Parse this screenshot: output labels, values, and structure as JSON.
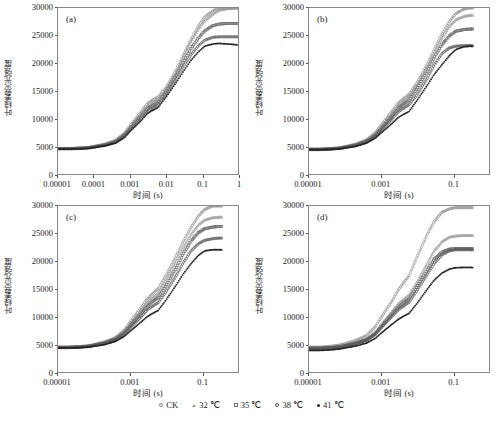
{
  "figure": {
    "ylabel": "叶绿素荧光强度",
    "xlabel": "时间 (s)",
    "panels": [
      {
        "tag": "(a)",
        "id": "a"
      },
      {
        "tag": "(b)",
        "id": "b"
      },
      {
        "tag": "(c)",
        "id": "c"
      },
      {
        "tag": "(d)",
        "id": "d"
      }
    ]
  },
  "legend": {
    "items": [
      {
        "label": "CK",
        "marker": "open-circle",
        "color": "#8c8c8c"
      },
      {
        "label": "32 ℃",
        "marker": "open-triangle",
        "color": "#9a9a9a"
      },
      {
        "label": "35 ℃",
        "marker": "open-square",
        "color": "#6e6e6e"
      },
      {
        "label": "38 ℃",
        "marker": "open-circle",
        "color": "#555555"
      },
      {
        "label": "41 ℃",
        "marker": "solid-dot",
        "color": "#222222"
      }
    ]
  },
  "yaxis": {
    "ticks": [
      "0",
      "5000",
      "10000",
      "15000",
      "20000",
      "25000",
      "30000"
    ],
    "min": 0,
    "max": 30000
  },
  "chart_data": [
    {
      "type": "line",
      "panel": "(a)",
      "title": "",
      "xlabel": "时间 (s)",
      "ylabel": "叶绿素荧光强度",
      "xscale": "log",
      "xlim": [
        1e-05,
        1
      ],
      "ylim": [
        0,
        30000
      ],
      "xticks": [
        "0.00001",
        "0.0001",
        "0.001",
        "0.01",
        "0.1",
        "1"
      ],
      "yticks": [
        0,
        5000,
        10000,
        15000,
        20000,
        25000,
        30000
      ],
      "grid": false,
      "legend_position": "bottom",
      "x": [
        2e-05,
        4e-05,
        7e-05,
        0.0001,
        0.0002,
        0.0004,
        0.0007,
        0.001,
        0.002,
        0.003,
        0.004,
        0.006,
        0.01,
        0.02,
        0.03,
        0.05,
        0.08,
        0.12,
        0.2,
        0.3,
        0.5,
        0.8,
        1.0
      ],
      "series": [
        {
          "name": "CK",
          "values": [
            4600,
            4700,
            4800,
            5000,
            5400,
            6100,
            7400,
            8700,
            11200,
            12700,
            13300,
            13900,
            15600,
            19000,
            21500,
            24400,
            26800,
            28400,
            29500,
            30000,
            30000,
            30000,
            30000
          ]
        },
        {
          "name": "32 ℃",
          "values": [
            4600,
            4700,
            4800,
            4950,
            5350,
            6000,
            7250,
            8500,
            10900,
            12300,
            12900,
            13500,
            15300,
            18600,
            21000,
            23900,
            26200,
            27700,
            28900,
            29600,
            29900,
            30000,
            30000
          ]
        },
        {
          "name": "35 ℃",
          "values": [
            4600,
            4650,
            4750,
            4900,
            5250,
            5850,
            7000,
            8200,
            10400,
            11700,
            12300,
            12900,
            14800,
            18000,
            20200,
            22700,
            24600,
            25900,
            26800,
            27100,
            27200,
            27200,
            27200
          ]
        },
        {
          "name": "38 ℃",
          "values": [
            4550,
            4600,
            4700,
            4850,
            5150,
            5700,
            6800,
            7900,
            9900,
            11200,
            11800,
            12400,
            14300,
            17400,
            19400,
            21600,
            23200,
            24200,
            24700,
            24800,
            24800,
            24800,
            24800
          ]
        },
        {
          "name": "41 ℃",
          "values": [
            4500,
            4550,
            4650,
            4800,
            5100,
            5600,
            6600,
            7700,
            9600,
            10900,
            11400,
            12000,
            13900,
            16700,
            18500,
            20600,
            22100,
            23100,
            23500,
            23600,
            23500,
            23400,
            23300
          ]
        }
      ]
    },
    {
      "type": "line",
      "panel": "(b)",
      "title": "",
      "xlabel": "时间 (s)",
      "ylabel": "叶绿素荧光强度",
      "xscale": "log",
      "xlim": [
        1e-05,
        1
      ],
      "ylim": [
        0,
        30000
      ],
      "xticks": [
        "0.00001",
        "0.001",
        "0.1"
      ],
      "yticks": [
        0,
        5000,
        10000,
        15000,
        20000,
        25000,
        30000
      ],
      "grid": false,
      "legend_position": "bottom",
      "x": [
        2e-05,
        4e-05,
        7e-05,
        0.0001,
        0.0002,
        0.0004,
        0.0007,
        0.001,
        0.002,
        0.003,
        0.004,
        0.006,
        0.01,
        0.02,
        0.03,
        0.05,
        0.08,
        0.12,
        0.2,
        0.3,
        0.5,
        0.8,
        1.0
      ],
      "series": [
        {
          "name": "CK",
          "values": [
            4500,
            4600,
            4750,
            4950,
            5400,
            6200,
            7500,
            8800,
            11300,
            12800,
            13500,
            14400,
            16500,
            20000,
            22500,
            25400,
            27600,
            29000,
            29800,
            30000,
            30000,
            30000,
            30000
          ]
        },
        {
          "name": "32 ℃",
          "values": [
            4500,
            4600,
            4700,
            4900,
            5300,
            6050,
            7300,
            8500,
            10900,
            12400,
            13100,
            14000,
            16100,
            19500,
            21900,
            24600,
            26700,
            27900,
            28500,
            28700,
            28700,
            28700,
            28700
          ]
        },
        {
          "name": "35 ℃",
          "values": [
            4450,
            4550,
            4650,
            4850,
            5200,
            5900,
            7000,
            8100,
            10400,
            11800,
            12500,
            13300,
            15400,
            18700,
            21000,
            23400,
            25000,
            25800,
            26100,
            26200,
            26200,
            26200,
            26200
          ]
        },
        {
          "name": "38 ℃",
          "values": [
            4400,
            4500,
            4600,
            4800,
            5150,
            5800,
            6850,
            7900,
            9900,
            11200,
            11800,
            12500,
            14300,
            17500,
            19700,
            21800,
            22800,
            23100,
            23200,
            23200,
            23200,
            23200,
            23200
          ]
        },
        {
          "name": "41 ℃",
          "values": [
            4400,
            4450,
            4550,
            4700,
            5000,
            5600,
            6500,
            7400,
            9100,
            10200,
            10700,
            11300,
            13300,
            16200,
            18000,
            19800,
            21400,
            22500,
            23000,
            23100,
            23000,
            23000,
            22900
          ]
        }
      ]
    },
    {
      "type": "line",
      "panel": "(c)",
      "title": "",
      "xlabel": "时间 (s)",
      "ylabel": "叶绿素荧光强度",
      "xscale": "log",
      "xlim": [
        1e-05,
        1
      ],
      "ylim": [
        0,
        30000
      ],
      "xticks": [
        "0.00001",
        "0.001",
        "0.1"
      ],
      "yticks": [
        0,
        5000,
        10000,
        15000,
        20000,
        25000,
        30000
      ],
      "grid": false,
      "legend_position": "bottom",
      "x": [
        2e-05,
        4e-05,
        7e-05,
        0.0001,
        0.0002,
        0.0004,
        0.0007,
        0.001,
        0.002,
        0.003,
        0.004,
        0.006,
        0.01,
        0.02,
        0.03,
        0.05,
        0.08,
        0.12,
        0.2,
        0.3,
        0.5,
        0.8,
        1.0
      ],
      "series": [
        {
          "name": "CK",
          "values": [
            4500,
            4600,
            4750,
            4950,
            5450,
            6250,
            7600,
            9000,
            11600,
            13200,
            14000,
            15000,
            17500,
            21200,
            23500,
            26200,
            28200,
            29400,
            30000,
            30000,
            30000,
            30000,
            30000
          ]
        },
        {
          "name": "32 ℃",
          "values": [
            4500,
            4600,
            4700,
            4900,
            5350,
            6100,
            7350,
            8650,
            11000,
            12500,
            13300,
            14200,
            16600,
            20200,
            22400,
            24900,
            26600,
            27500,
            27900,
            28000,
            28000,
            28000,
            28000
          ]
        },
        {
          "name": "35 ℃",
          "values": [
            4450,
            4550,
            4650,
            4850,
            5250,
            5950,
            7100,
            8300,
            10500,
            11900,
            12600,
            13400,
            15600,
            19000,
            21300,
            23700,
            25200,
            25900,
            26200,
            26300,
            26300,
            26300,
            26300
          ]
        },
        {
          "name": "38 ℃",
          "values": [
            4400,
            4500,
            4600,
            4800,
            5150,
            5800,
            6850,
            7950,
            9900,
            11200,
            11800,
            12500,
            14500,
            17600,
            19700,
            21900,
            23200,
            23800,
            24100,
            24200,
            24200,
            24200,
            24200
          ]
        },
        {
          "name": "41 ℃",
          "values": [
            4350,
            4400,
            4500,
            4650,
            4950,
            5550,
            6450,
            7350,
            9000,
            10000,
            10500,
            11100,
            13000,
            15900,
            17700,
            19600,
            21100,
            21900,
            22100,
            22100,
            22000,
            21900,
            21800
          ]
        }
      ]
    },
    {
      "type": "line",
      "panel": "(d)",
      "title": "",
      "xlabel": "时间 (s)",
      "ylabel": "叶绿素荧光强度",
      "xscale": "log",
      "xlim": [
        1e-05,
        1
      ],
      "ylim": [
        0,
        30000
      ],
      "xticks": [
        "0.00001",
        "0.001",
        "0.1"
      ],
      "yticks": [
        0,
        5000,
        10000,
        15000,
        20000,
        25000,
        30000
      ],
      "grid": false,
      "legend_position": "bottom",
      "x": [
        2e-05,
        4e-05,
        7e-05,
        0.0001,
        0.0002,
        0.0004,
        0.0007,
        0.001,
        0.002,
        0.003,
        0.004,
        0.006,
        0.01,
        0.02,
        0.03,
        0.05,
        0.08,
        0.12,
        0.2,
        0.3,
        0.5,
        0.8,
        1.0
      ],
      "series": [
        {
          "name": "CK",
          "values": [
            4500,
            4650,
            4850,
            5100,
            5700,
            6600,
            8200,
            9800,
            12800,
            14800,
            15900,
            17400,
            20800,
            25100,
            27200,
            28900,
            29500,
            29700,
            29700,
            29700,
            29700,
            29700,
            29700
          ]
        },
        {
          "name": "32 ℃",
          "values": [
            4400,
            4500,
            4650,
            4850,
            5300,
            6000,
            7200,
            8500,
            10900,
            12300,
            13000,
            13900,
            16200,
            19800,
            21900,
            23600,
            24400,
            24600,
            24700,
            24700,
            24600,
            24600,
            24600
          ]
        },
        {
          "name": "35 ℃",
          "values": [
            4300,
            4400,
            4550,
            4750,
            5200,
            5850,
            6950,
            8150,
            10400,
            11700,
            12400,
            13200,
            15400,
            18600,
            20400,
            21700,
            22200,
            22300,
            22300,
            22300,
            22200,
            22200,
            22200
          ]
        },
        {
          "name": "38 ℃",
          "values": [
            4250,
            4350,
            4500,
            4700,
            5100,
            5750,
            6800,
            7950,
            10000,
            11200,
            11800,
            12600,
            14700,
            17800,
            19600,
            21200,
            21900,
            22100,
            22100,
            22100,
            22000,
            22000,
            21900
          ]
        },
        {
          "name": "41 ℃",
          "values": [
            3900,
            4000,
            4150,
            4350,
            4700,
            5250,
            6100,
            7000,
            8600,
            9500,
            10000,
            10600,
            12400,
            15100,
            16600,
            17900,
            18600,
            18850,
            18900,
            18900,
            18800,
            18700,
            18600
          ]
        }
      ]
    }
  ]
}
